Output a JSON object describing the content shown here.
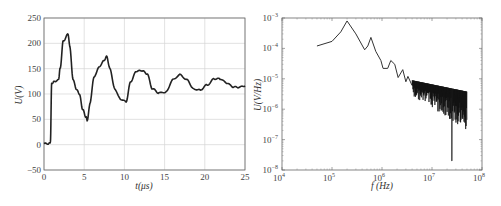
{
  "chart_data": [
    {
      "type": "line",
      "title": "",
      "xlabel": "t(μs)",
      "ylabel": "U(V)",
      "xlim": [
        0,
        25
      ],
      "ylim": [
        -50,
        250
      ],
      "xticks": [
        "0",
        "5",
        "10",
        "15",
        "20",
        "25"
      ],
      "yticks": [
        "-50",
        "0",
        "50",
        "100",
        "150",
        "200",
        "250"
      ],
      "grid": true,
      "series": [
        {
          "name": "U(t)",
          "x": [
            0,
            0.6,
            0.8,
            0.95,
            1.2,
            1.8,
            2.0,
            2.4,
            3.0,
            3.2,
            3.6,
            4.0,
            4.4,
            4.8,
            5.2,
            5.4,
            5.7,
            6.2,
            6.8,
            7.4,
            7.8,
            8.2,
            8.8,
            9.5,
            10.2,
            10.8,
            11.5,
            12.2,
            12.8,
            13.5,
            14.3,
            15.2,
            16.0,
            16.9,
            17.8,
            18.6,
            19.4,
            20.3,
            21.2,
            21.9,
            22.7,
            23.5,
            24.2,
            25.0
          ],
          "y": [
            2,
            2,
            5,
            120,
            124,
            128,
            150,
            205,
            218,
            195,
            130,
            110,
            100,
            70,
            55,
            48,
            80,
            132,
            152,
            165,
            174,
            150,
            110,
            90,
            85,
            125,
            145,
            146,
            140,
            110,
            102,
            104,
            128,
            138,
            128,
            110,
            108,
            118,
            130,
            130,
            122,
            114,
            113,
            116
          ]
        }
      ]
    },
    {
      "type": "line",
      "title": "",
      "xlabel": "f (Hz)",
      "ylabel": "U(V/Hz)",
      "xscale": "log",
      "yscale": "log",
      "xlim": [
        10000,
        100000000
      ],
      "ylim": [
        1e-08,
        0.001
      ],
      "xticks": [
        "10^4",
        "10^5",
        "10^6",
        "10^7",
        "10^8"
      ],
      "yticks": [
        "10^-8",
        "10^-7",
        "10^-6",
        "10^-5",
        "10^-4",
        "10^-3"
      ],
      "grid": false,
      "series": [
        {
          "name": "U(f)",
          "x": [
            50000,
            100000,
            150000,
            200000,
            300000,
            450000,
            520000,
            600000,
            750000,
            950000,
            1050000,
            1300000,
            1500000,
            1800000,
            2100000,
            2600000,
            3000000,
            3300000,
            4000000,
            5000000,
            7000000,
            10000000,
            15000000,
            25000000,
            35000000,
            50000000
          ],
          "y": [
            0.00012,
            0.00017,
            0.00035,
            0.0008,
            0.0003,
            9e-05,
            0.00012,
            0.00023,
            8e-05,
            4e-05,
            2.2e-05,
            2.2e-05,
            4e-05,
            3e-05,
            1.1e-05,
            2e-05,
            8e-06,
            1.2e-05,
            6e-06,
            8e-06,
            5e-06,
            3.5e-06,
            2.5e-06,
            1.8e-06,
            1.5e-06,
            1.5e-06
          ]
        }
      ],
      "noise_band": {
        "from_hz": 4000000,
        "to_hz": 50000000,
        "deepest_dip": {
          "x": 25000000,
          "y": 2e-08
        }
      }
    }
  ],
  "left_chart": {
    "xlabel": "t(μs)",
    "ylabel": "U(V)",
    "xticks": [
      "0",
      "5",
      "10",
      "15",
      "20",
      "25"
    ],
    "yticks": [
      "250",
      "200",
      "150",
      "100",
      "50",
      "0",
      "−50"
    ]
  },
  "right_chart": {
    "xlabel": "f (Hz)",
    "ylabel": "U(V/Hz)",
    "xticks": [
      {
        "base": "10",
        "exp": "4"
      },
      {
        "base": "10",
        "exp": "5"
      },
      {
        "base": "10",
        "exp": "6"
      },
      {
        "base": "10",
        "exp": "7"
      },
      {
        "base": "10",
        "exp": "8"
      }
    ],
    "yticks": [
      {
        "base": "10",
        "exp": "-3"
      },
      {
        "base": "10",
        "exp": "-4"
      },
      {
        "base": "10",
        "exp": "-5"
      },
      {
        "base": "10",
        "exp": "-6"
      },
      {
        "base": "10",
        "exp": "-7"
      },
      {
        "base": "10",
        "exp": "-8"
      }
    ]
  },
  "colors": {
    "line": "#222222",
    "grid": "#d6d6d6",
    "axis": "#555555"
  }
}
